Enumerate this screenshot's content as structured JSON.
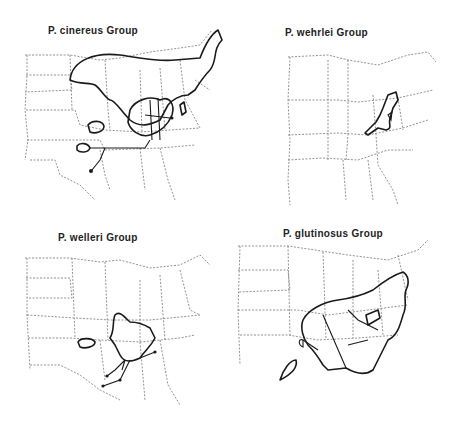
{
  "figure": {
    "panels": [
      {
        "id": "cinereus",
        "title": "P. cinereus Group"
      },
      {
        "id": "wehrlei",
        "title": "P. wehrlei Group"
      },
      {
        "id": "welleri",
        "title": "P. welleri Group"
      },
      {
        "id": "glutinosus",
        "title": "P. glutinosus Group"
      }
    ],
    "map_region": "Eastern United States (state boundaries dashed)",
    "colors": {
      "range_outline": "#1a1a1a",
      "state_border": "#777777",
      "background": "#ffffff"
    }
  }
}
